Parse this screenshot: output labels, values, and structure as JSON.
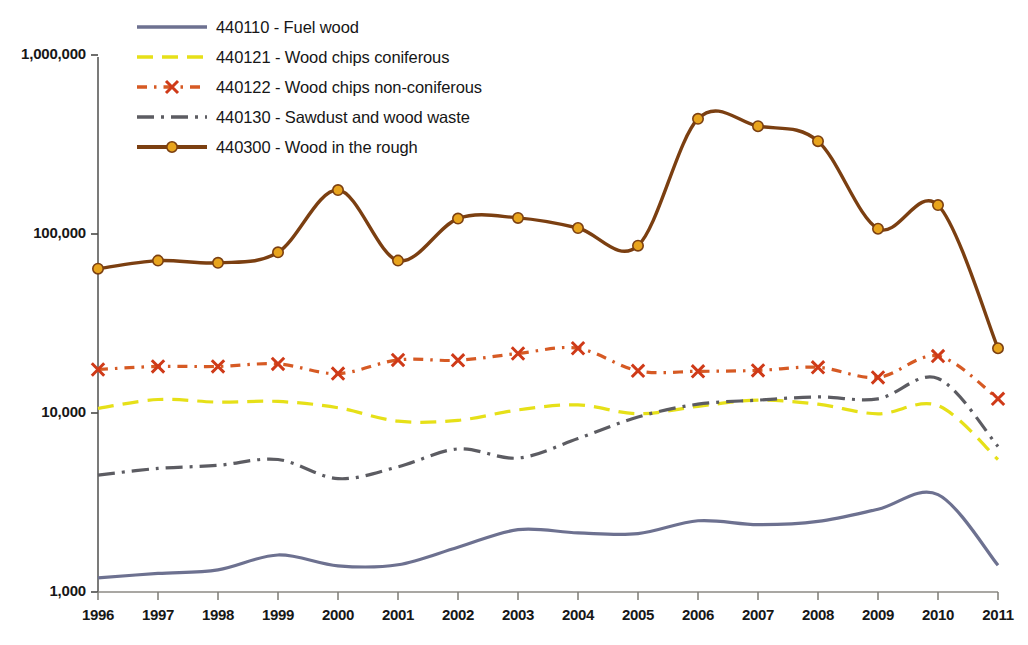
{
  "chart_data": {
    "type": "line",
    "title": "",
    "xlabel": "",
    "ylabel": "",
    "yscale": "log",
    "ylim": [
      1000,
      1000000
    ],
    "grid": false,
    "legend_position": "top-left",
    "x": [
      1996,
      1997,
      1998,
      1999,
      2000,
      2001,
      2002,
      2003,
      2004,
      2005,
      2006,
      2007,
      2008,
      2009,
      2010,
      2011
    ],
    "categories": [
      "1996",
      "1997",
      "1998",
      "1999",
      "2000",
      "2001",
      "2002",
      "2003",
      "2004",
      "2005",
      "2006",
      "2007",
      "2008",
      "2009",
      "2010",
      "2011"
    ],
    "ytick_labels": [
      "1,000",
      "10,000",
      "100,000",
      "1,000,000"
    ],
    "ytick_values": [
      1000,
      10000,
      100000,
      1000000
    ],
    "series": [
      {
        "code": "440110",
        "name": "440110 - Fuel wood",
        "label": "440110 - Fuel wood",
        "color": "#6d7190",
        "dash": "solid",
        "marker": "none",
        "values": [
          1200,
          1270,
          1330,
          1610,
          1400,
          1420,
          1780,
          2230,
          2140,
          2120,
          2500,
          2380,
          2480,
          2900,
          3500,
          1410
        ]
      },
      {
        "code": "440121",
        "name": "440121 - Wood chips coniferous",
        "label": "440121 - Wood chips coniferous",
        "color": "#e6e018",
        "dash": "dashed",
        "marker": "none",
        "values": [
          10600,
          11900,
          11500,
          11600,
          10700,
          9000,
          9100,
          10400,
          11100,
          9900,
          10900,
          11800,
          11200,
          9900,
          11000,
          5500
        ]
      },
      {
        "code": "440122",
        "name": "440122 - Wood chips non-coniferous",
        "label": "440122 - Wood chips non-coniferous",
        "color": "#d65a24",
        "dash": "dash-dot",
        "marker": "x",
        "values": [
          17500,
          18200,
          18200,
          18800,
          16600,
          19800,
          19700,
          21500,
          23000,
          17200,
          17100,
          17300,
          18000,
          15800,
          20800,
          12000
        ]
      },
      {
        "code": "440130",
        "name": "440130 - Sawdust and wood waste",
        "label": "440130 - Sawdust and wood waste",
        "color": "#5c5c62",
        "dash": "dash-dot-long",
        "marker": "none",
        "values": [
          4500,
          4900,
          5100,
          5500,
          4300,
          5000,
          6300,
          5600,
          7200,
          9500,
          11200,
          11800,
          12300,
          12000,
          15600,
          6500
        ]
      },
      {
        "code": "440300",
        "name": "440300 - Wood in the rough",
        "label": "440300 - Wood in the rough",
        "color": "#7b3f11",
        "marker_color": "#e8a41d",
        "dash": "solid",
        "marker": "circle",
        "values": [
          64000,
          71000,
          69000,
          79000,
          176000,
          71000,
          122000,
          123000,
          108000,
          86000,
          440000,
          400000,
          330000,
          107000,
          145000,
          23000
        ]
      }
    ]
  },
  "axis": {
    "y_labels": [
      "1,000,000",
      "100,000",
      "10,000",
      "1,000"
    ],
    "x_labels": [
      "1996",
      "1997",
      "1998",
      "1999",
      "2000",
      "2001",
      "2002",
      "2003",
      "2004",
      "2005",
      "2006",
      "2007",
      "2008",
      "2009",
      "2010",
      "2011"
    ]
  },
  "legend": {
    "items": [
      {
        "label": "440110 - Fuel wood",
        "color": "#6d7190"
      },
      {
        "label": "440121 - Wood chips coniferous",
        "color": "#e6e018"
      },
      {
        "label": "440122 - Wood chips non-coniferous",
        "color": "#d65a24"
      },
      {
        "label": "440130 - Sawdust and wood waste",
        "color": "#5c5c62"
      },
      {
        "label": "440300 - Wood in the rough",
        "color": "#7b3f11"
      }
    ]
  }
}
